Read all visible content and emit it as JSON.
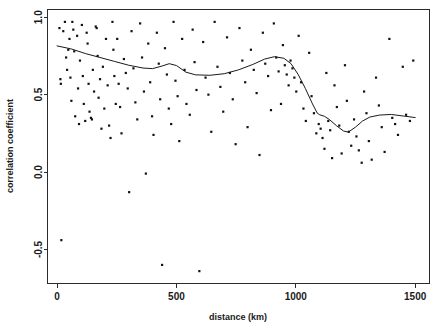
{
  "chart_data": {
    "type": "scatter",
    "title": "",
    "xlabel": "distance (km)",
    "ylabel": "correlation coefficient",
    "xlim": [
      -40,
      1560
    ],
    "ylim": [
      -0.72,
      1.05
    ],
    "xticks": [
      0,
      500,
      1000,
      1500
    ],
    "xticklabels": [
      "0",
      "500",
      "1000",
      "1500"
    ],
    "yticks": [
      -0.5,
      0.0,
      0.5,
      1.0
    ],
    "yticklabels": [
      "-0.5",
      "0.0",
      "0.5",
      "1.0"
    ],
    "grid": false,
    "legend": null,
    "series": [
      {
        "name": "correlation vs distance",
        "marker": "point",
        "points": [
          [
            10,
            0.93
          ],
          [
            14,
            0.6
          ],
          [
            16,
            0.57
          ],
          [
            18,
            -0.44
          ],
          [
            26,
            0.91
          ],
          [
            33,
            0.97
          ],
          [
            38,
            0.74
          ],
          [
            42,
            0.66
          ],
          [
            47,
            0.79
          ],
          [
            52,
            0.86
          ],
          [
            56,
            0.61
          ],
          [
            60,
            0.46
          ],
          [
            64,
            0.97
          ],
          [
            68,
            0.92
          ],
          [
            72,
            0.78
          ],
          [
            76,
            0.36
          ],
          [
            84,
            0.88
          ],
          [
            88,
            0.54
          ],
          [
            92,
            0.31
          ],
          [
            96,
            0.72
          ],
          [
            104,
            0.95
          ],
          [
            108,
            0.62
          ],
          [
            112,
            0.44
          ],
          [
            118,
            0.33
          ],
          [
            124,
            0.9
          ],
          [
            128,
            0.83
          ],
          [
            132,
            0.57
          ],
          [
            136,
            0.39
          ],
          [
            142,
            0.35
          ],
          [
            146,
            0.34
          ],
          [
            150,
            0.66
          ],
          [
            155,
            0.52
          ],
          [
            162,
            0.94
          ],
          [
            166,
            0.93
          ],
          [
            170,
            0.75
          ],
          [
            174,
            0.48
          ],
          [
            180,
            0.6
          ],
          [
            186,
            0.28
          ],
          [
            192,
            0.68
          ],
          [
            198,
            0.41
          ],
          [
            205,
            0.86
          ],
          [
            212,
            0.56
          ],
          [
            218,
            0.3
          ],
          [
            224,
            0.22
          ],
          [
            232,
            0.97
          ],
          [
            236,
            0.79
          ],
          [
            240,
            0.62
          ],
          [
            246,
            0.44
          ],
          [
            252,
            0.86
          ],
          [
            258,
            0.57
          ],
          [
            264,
            0.42
          ],
          [
            270,
            0.25
          ],
          [
            280,
            0.73
          ],
          [
            288,
            0.64
          ],
          [
            296,
            0.54
          ],
          [
            302,
            -0.13
          ],
          [
            312,
            0.91
          ],
          [
            320,
            0.67
          ],
          [
            328,
            0.45
          ],
          [
            336,
            0.34
          ],
          [
            348,
            0.96
          ],
          [
            356,
            0.74
          ],
          [
            364,
            0.52
          ],
          [
            372,
            -0.01
          ],
          [
            382,
            0.83
          ],
          [
            390,
            0.58
          ],
          [
            398,
            0.36
          ],
          [
            404,
            0.24
          ],
          [
            418,
            0.9
          ],
          [
            426,
            0.7
          ],
          [
            432,
            0.47
          ],
          [
            440,
            -0.6
          ],
          [
            452,
            0.8
          ],
          [
            460,
            0.63
          ],
          [
            468,
            0.41
          ],
          [
            478,
            0.31
          ],
          [
            488,
            0.97
          ],
          [
            496,
            0.59
          ],
          [
            505,
            0.49
          ],
          [
            512,
            0.2
          ],
          [
            524,
            0.86
          ],
          [
            534,
            0.66
          ],
          [
            542,
            0.44
          ],
          [
            556,
            0.37
          ],
          [
            568,
            0.92
          ],
          [
            576,
            0.71
          ],
          [
            584,
            0.53
          ],
          [
            596,
            -0.64
          ],
          [
            612,
            0.84
          ],
          [
            622,
            0.61
          ],
          [
            634,
            0.5
          ],
          [
            646,
            0.26
          ],
          [
            660,
            0.97
          ],
          [
            672,
            0.68
          ],
          [
            684,
            0.55
          ],
          [
            696,
            0.39
          ],
          [
            712,
            0.87
          ],
          [
            724,
            0.64
          ],
          [
            736,
            0.47
          ],
          [
            748,
            0.18
          ],
          [
            764,
            0.93
          ],
          [
            776,
            0.72
          ],
          [
            788,
            0.58
          ],
          [
            798,
            0.29
          ],
          [
            812,
            0.79
          ],
          [
            824,
            0.66
          ],
          [
            836,
            0.51
          ],
          [
            848,
            0.11
          ],
          [
            862,
            0.9
          ],
          [
            872,
            0.7
          ],
          [
            884,
            0.62
          ],
          [
            896,
            0.4
          ],
          [
            908,
            0.96
          ],
          [
            918,
            0.74
          ],
          [
            928,
            0.65
          ],
          [
            938,
            0.44
          ],
          [
            946,
            0.82
          ],
          [
            954,
            0.69
          ],
          [
            962,
            0.63
          ],
          [
            970,
            0.56
          ],
          [
            978,
            0.72
          ],
          [
            986,
            0.67
          ],
          [
            994,
            0.61
          ],
          [
            1002,
            0.52
          ],
          [
            1012,
            0.88
          ],
          [
            1022,
            0.58
          ],
          [
            1032,
            0.41
          ],
          [
            1042,
            0.33
          ],
          [
            1056,
            0.77
          ],
          [
            1066,
            0.49
          ],
          [
            1076,
            0.38
          ],
          [
            1086,
            0.25
          ],
          [
            1096,
            0.31
          ],
          [
            1104,
            0.28
          ],
          [
            1112,
            0.22
          ],
          [
            1120,
            0.15
          ],
          [
            1128,
            0.64
          ],
          [
            1136,
            0.33
          ],
          [
            1144,
            0.27
          ],
          [
            1152,
            0.09
          ],
          [
            1162,
            0.56
          ],
          [
            1172,
            0.42
          ],
          [
            1182,
            0.3
          ],
          [
            1192,
            0.12
          ],
          [
            1206,
            0.69
          ],
          [
            1214,
            0.46
          ],
          [
            1222,
            0.26
          ],
          [
            1232,
            0.17
          ],
          [
            1244,
            0.34
          ],
          [
            1254,
            0.23
          ],
          [
            1264,
            0.14
          ],
          [
            1276,
            0.06
          ],
          [
            1286,
            0.52
          ],
          [
            1296,
            0.38
          ],
          [
            1306,
            0.2
          ],
          [
            1318,
            0.08
          ],
          [
            1336,
            0.61
          ],
          [
            1348,
            0.43
          ],
          [
            1360,
            0.29
          ],
          [
            1372,
            0.13
          ],
          [
            1392,
            0.86
          ],
          [
            1404,
            0.35
          ],
          [
            1416,
            0.31
          ],
          [
            1428,
            0.24
          ],
          [
            1448,
            0.68
          ],
          [
            1462,
            0.37
          ],
          [
            1478,
            0.33
          ],
          [
            1492,
            0.72
          ]
        ]
      }
    ],
    "smooth_line": {
      "name": "lowess smoother",
      "points": [
        [
          0,
          0.815
        ],
        [
          60,
          0.795
        ],
        [
          120,
          0.765
        ],
        [
          180,
          0.74
        ],
        [
          240,
          0.715
        ],
        [
          300,
          0.69
        ],
        [
          360,
          0.672
        ],
        [
          400,
          0.668
        ],
        [
          440,
          0.685
        ],
        [
          470,
          0.7
        ],
        [
          500,
          0.688
        ],
        [
          540,
          0.645
        ],
        [
          580,
          0.628
        ],
        [
          640,
          0.625
        ],
        [
          700,
          0.635
        ],
        [
          760,
          0.66
        ],
        [
          820,
          0.695
        ],
        [
          870,
          0.73
        ],
        [
          910,
          0.745
        ],
        [
          950,
          0.735
        ],
        [
          980,
          0.7
        ],
        [
          1010,
          0.63
        ],
        [
          1040,
          0.54
        ],
        [
          1070,
          0.44
        ],
        [
          1090,
          0.38
        ],
        [
          1100,
          0.37
        ],
        [
          1120,
          0.36
        ],
        [
          1140,
          0.34
        ],
        [
          1170,
          0.3
        ],
        [
          1200,
          0.265
        ],
        [
          1220,
          0.258
        ],
        [
          1250,
          0.29
        ],
        [
          1280,
          0.33
        ],
        [
          1310,
          0.355
        ],
        [
          1350,
          0.368
        ],
        [
          1400,
          0.372
        ],
        [
          1450,
          0.362
        ],
        [
          1500,
          0.352
        ]
      ]
    }
  },
  "axes": {
    "x_axis_title": "distance (km)",
    "y_axis_title": "correlation coefficient",
    "x_tick_labels": [
      "0",
      "500",
      "1000",
      "1500"
    ],
    "y_tick_labels": [
      "1.0",
      "0.5",
      "0.0",
      "-0.5"
    ]
  }
}
